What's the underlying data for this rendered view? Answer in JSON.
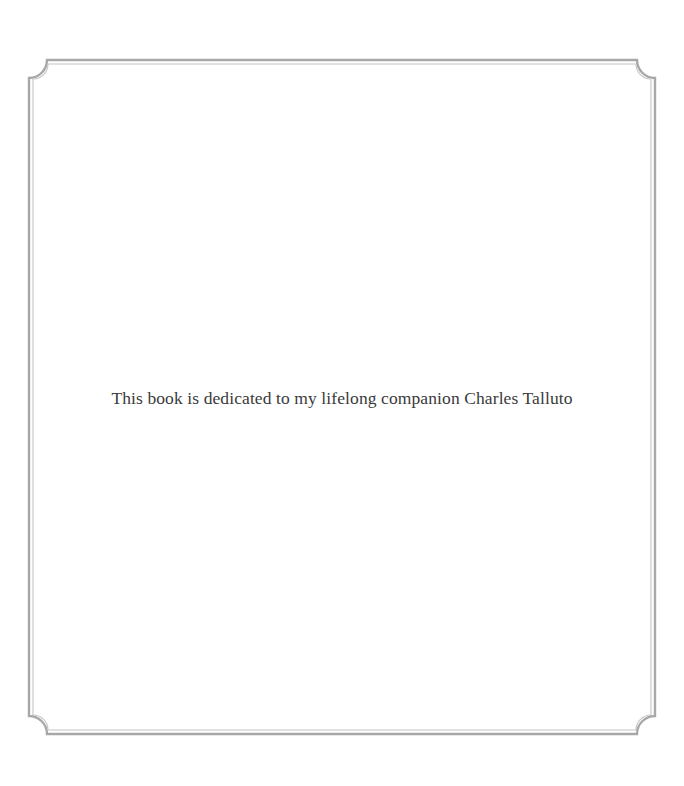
{
  "page": {
    "dedication_text": "This book is dedicated to my lifelong companion Charles Talluto"
  },
  "frame": {
    "style": "double-rule border with concave notched corners",
    "outer_color": "#a8a8a8",
    "inner_color": "#c4c4c4"
  }
}
